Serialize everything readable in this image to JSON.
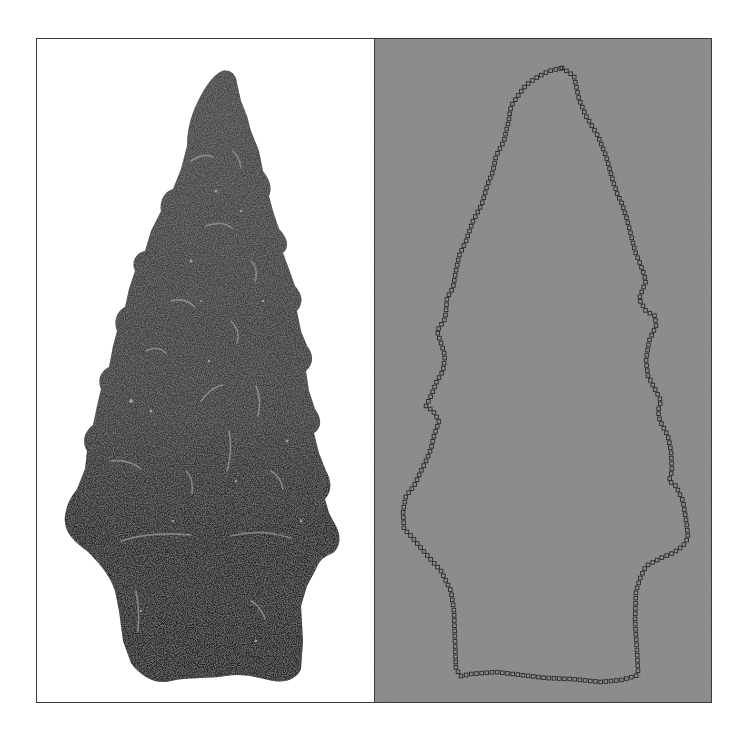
{
  "figure": {
    "left_panel": {
      "label": "Photograph of serrated stone projectile point",
      "background_color": "#ffffff",
      "object_color": "#3b3b3b"
    },
    "right_panel": {
      "label": "Digitized outline landmarks of projectile point",
      "background_color": "#858585",
      "marker_shape": "hollow-square",
      "marker_color": "#2a2a2a"
    },
    "frame_color": "#3a3a3a"
  }
}
